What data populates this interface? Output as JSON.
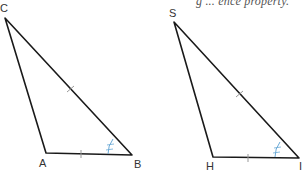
{
  "caption": "g ... ence property.",
  "colors": {
    "stroke": "#1a1a1a",
    "tick": "#999999",
    "angle_mark": "#6aa9d6",
    "label": "#333333"
  },
  "triangles": [
    {
      "name": "triangle-CAB",
      "vertices": {
        "top": "C",
        "left": "A",
        "right": "B"
      },
      "labels": {
        "top": "C",
        "left": "A",
        "right": "B"
      }
    },
    {
      "name": "triangle-SHI",
      "vertices": {
        "top": "S",
        "left": "H",
        "right": "I"
      },
      "labels": {
        "top": "S",
        "left": "H",
        "right": "I"
      }
    }
  ]
}
